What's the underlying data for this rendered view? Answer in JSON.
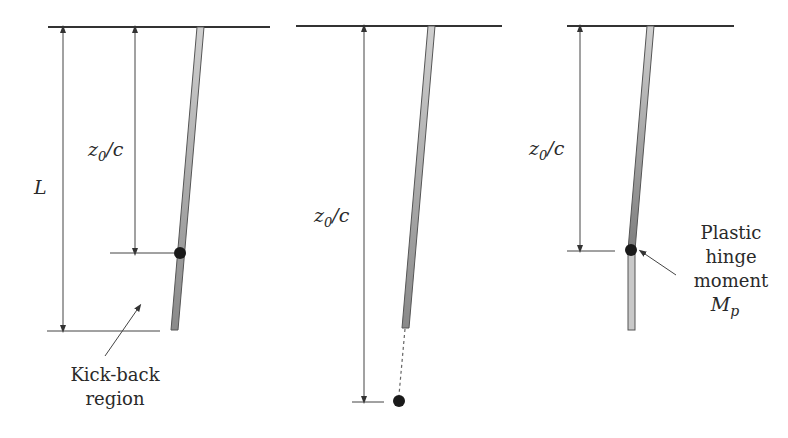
{
  "figure": {
    "panels": [
      {
        "id": "panel-1",
        "labels": {
          "length": "L",
          "depth_main": "z",
          "depth_sub": "0",
          "depth_suffix": "/c",
          "region_line1": "Kick-back",
          "region_line2": "region"
        }
      },
      {
        "id": "panel-2",
        "labels": {
          "depth_main": "z",
          "depth_sub": "0",
          "depth_suffix": "/c"
        }
      },
      {
        "id": "panel-3",
        "labels": {
          "depth_main": "z",
          "depth_sub": "0",
          "depth_suffix": "/c",
          "hinge_line1": "Plastic",
          "hinge_line2": "hinge",
          "hinge_line3": "moment",
          "hinge_symbol": "M",
          "hinge_symbol_sub": "p"
        }
      }
    ],
    "colors": {
      "line": "#333333",
      "pile_light": "#c4c4c4",
      "pile_dark": "#8a8a8a",
      "hinge": "#1a1a1a",
      "text": "#2a2a2a"
    }
  }
}
